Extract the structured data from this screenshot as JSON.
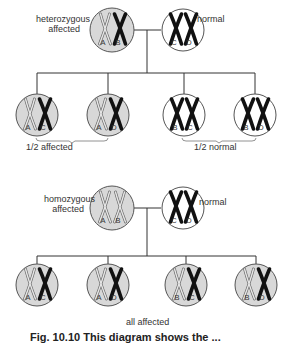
{
  "colors": {
    "affected_fill": "#d8d8d8",
    "normal_fill": "#ffffff",
    "outline": "#555555",
    "chromosome_dark": "#111111",
    "line": "#333333"
  },
  "cross1": {
    "parent_affected_label_1": "heterozygous",
    "parent_affected_label_2": "affected",
    "parent_normal_label": "normal",
    "parents": [
      {
        "id": "het-affected",
        "affected": true,
        "chromosomes": [
          {
            "label": "A",
            "type": "mutant"
          },
          {
            "label": "B",
            "type": "normal"
          }
        ]
      },
      {
        "id": "normal",
        "affected": false,
        "chromosomes": [
          {
            "label": "C",
            "type": "normal"
          },
          {
            "label": "D",
            "type": "normal"
          }
        ]
      }
    ],
    "offspring": [
      {
        "affected": true,
        "chromosomes": [
          {
            "label": "A",
            "type": "mutant"
          },
          {
            "label": "C",
            "type": "normal"
          }
        ]
      },
      {
        "affected": true,
        "chromosomes": [
          {
            "label": "A",
            "type": "mutant"
          },
          {
            "label": "D",
            "type": "normal"
          }
        ]
      },
      {
        "affected": false,
        "chromosomes": [
          {
            "label": "B",
            "type": "normal"
          },
          {
            "label": "C",
            "type": "normal"
          }
        ]
      },
      {
        "affected": false,
        "chromosomes": [
          {
            "label": "B",
            "type": "normal"
          },
          {
            "label": "D",
            "type": "normal"
          }
        ]
      }
    ],
    "group_affected_label": "1/2  affected",
    "group_normal_label": "1/2  normal"
  },
  "cross2": {
    "parent_affected_label_1": "homozygous",
    "parent_affected_label_2": "affected",
    "parent_normal_label": "normal",
    "parents": [
      {
        "id": "hom-affected",
        "affected": true,
        "chromosomes": [
          {
            "label": "A",
            "type": "mutant"
          },
          {
            "label": "B",
            "type": "mutant"
          }
        ]
      },
      {
        "id": "normal",
        "affected": false,
        "chromosomes": [
          {
            "label": "C",
            "type": "normal"
          },
          {
            "label": "D",
            "type": "normal"
          }
        ]
      }
    ],
    "offspring": [
      {
        "affected": true,
        "chromosomes": [
          {
            "label": "A",
            "type": "mutant"
          },
          {
            "label": "C",
            "type": "normal"
          }
        ]
      },
      {
        "affected": true,
        "chromosomes": [
          {
            "label": "A",
            "type": "mutant"
          },
          {
            "label": "D",
            "type": "normal"
          }
        ]
      },
      {
        "affected": true,
        "chromosomes": [
          {
            "label": "B",
            "type": "mutant"
          },
          {
            "label": "C",
            "type": "normal"
          }
        ]
      },
      {
        "affected": true,
        "chromosomes": [
          {
            "label": "B",
            "type": "mutant"
          },
          {
            "label": "D",
            "type": "normal"
          }
        ]
      }
    ],
    "all_label": "all affected"
  },
  "caption": "Fig. 10.10   This diagram shows the ..."
}
